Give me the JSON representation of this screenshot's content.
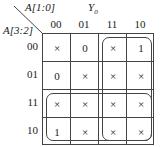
{
  "title": "Y0",
  "col_var": "A[1:0]",
  "row_var": "A[3:2]",
  "columns": [
    "00",
    "01",
    "11",
    "10"
  ],
  "rows": [
    "00",
    "01",
    "11",
    "10"
  ],
  "cells": [
    [
      "×",
      "0",
      "×",
      "1"
    ],
    [
      "0",
      "×",
      "×",
      "×"
    ],
    [
      "×",
      "×",
      "×",
      "×"
    ],
    [
      "1",
      "×",
      "×",
      "×"
    ]
  ],
  "groups": [
    {
      "name": "cols-11-10",
      "rows": [
        0,
        3
      ],
      "cols": [
        2,
        3
      ]
    },
    {
      "name": "rows-11-10",
      "rows": [
        2,
        3
      ],
      "cols": [
        0,
        3
      ]
    }
  ]
}
